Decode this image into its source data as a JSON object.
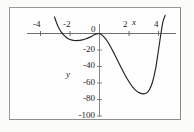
{
  "chart_data": {
    "type": "line",
    "title": "",
    "subtitle": "",
    "xlabel": "x",
    "ylabel": "y",
    "xlim": [
      -5.2,
      5.0
    ],
    "ylim": [
      -108,
      22
    ],
    "grid": false,
    "legend": null,
    "x_ticks": [
      {
        "value": -4,
        "label": "-4"
      },
      {
        "value": -2,
        "label": "-2"
      },
      {
        "value": 0,
        "label": "0"
      },
      {
        "value": 2,
        "label": "2"
      },
      {
        "value": 4,
        "label": "4"
      }
    ],
    "y_ticks": [
      {
        "value": 0,
        "label": "0"
      },
      {
        "value": -20,
        "label": "-20"
      },
      {
        "value": -40,
        "label": "-40"
      },
      {
        "value": -60,
        "label": "-60"
      },
      {
        "value": -80,
        "label": "-80"
      },
      {
        "value": -100,
        "label": "-100"
      }
    ],
    "series": [
      {
        "name": "curve",
        "color": "#232323",
        "x": [
          -3.05,
          -2.9,
          -2.75,
          -2.6,
          -2.45,
          -2.3,
          -2.15,
          -2.0,
          -1.85,
          -1.7,
          -1.55,
          -1.4,
          -1.25,
          -1.1,
          -0.95,
          -0.8,
          -0.65,
          -0.5,
          -0.35,
          -0.2,
          -0.05,
          0.1,
          0.3,
          0.5,
          0.75,
          1.0,
          1.25,
          1.5,
          1.75,
          2.0,
          2.25,
          2.5,
          2.75,
          3.0,
          3.2,
          3.4,
          3.6,
          3.8,
          4.0,
          4.15,
          4.3,
          4.45
        ],
        "y": [
          20.0,
          12.5,
          6.5,
          2.0,
          -1.4,
          -4.0,
          -6.0,
          -7.3,
          -8.1,
          -8.5,
          -8.6,
          -8.4,
          -8.0,
          -7.4,
          -6.6,
          -5.6,
          -4.4,
          -3.0,
          -1.6,
          -0.5,
          0.0,
          -1.0,
          -4.0,
          -8.5,
          -16.0,
          -24.5,
          -33.5,
          -42.5,
          -51.0,
          -58.5,
          -65.0,
          -69.5,
          -72.3,
          -73.2,
          -72.0,
          -67.5,
          -58.5,
          -43.0,
          -20.0,
          -2.0,
          14.0,
          22.0
        ]
      }
    ],
    "features": {
      "local_min_left": {
        "x": -1.55,
        "y": -8.6
      },
      "local_max_origin": {
        "x": -0.05,
        "y": 0.0
      },
      "global_min": {
        "x": 3.0,
        "y": -73.2
      },
      "roots": [
        -2.45,
        -0.05,
        0.05,
        4.15
      ]
    }
  },
  "axis_labels": {
    "x_name": "x",
    "y_name": "y"
  }
}
